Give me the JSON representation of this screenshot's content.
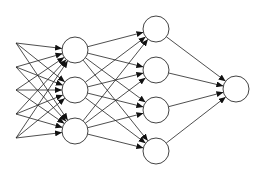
{
  "diagram": {
    "type": "feedforward-neural-network",
    "colors": {
      "stroke": "#222222",
      "node_fill": "#ffffff",
      "background": "#ffffff"
    },
    "layers": [
      {
        "name": "input",
        "kind": "points",
        "x": 16,
        "ys": [
          43,
          67,
          90,
          114,
          138
        ]
      },
      {
        "name": "hidden-1",
        "kind": "nodes",
        "x": 75,
        "r": 13,
        "ys": [
          50,
          90,
          131
        ]
      },
      {
        "name": "hidden-2",
        "kind": "nodes",
        "x": 156,
        "r": 13,
        "ys": [
          29,
          70,
          110,
          151
        ]
      },
      {
        "name": "output",
        "kind": "nodes",
        "x": 236,
        "r": 13,
        "ys": [
          89
        ]
      }
    ],
    "connectivity": "fully-connected-with-arrows"
  }
}
